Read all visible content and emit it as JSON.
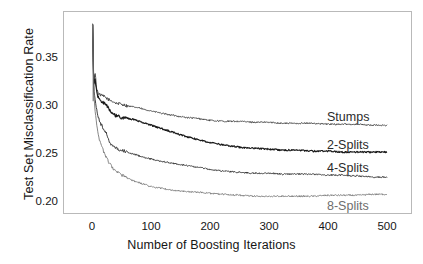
{
  "chart_data": {
    "type": "line",
    "title": "",
    "xlabel": "Number of Boosting Iterations",
    "ylabel": "Test Set Misclassification Rate",
    "xlim": [
      0,
      500
    ],
    "ylim": [
      0.19,
      0.395
    ],
    "grid": false,
    "legend_position": "inline-right",
    "xticks": [
      "0",
      "100",
      "200",
      "300",
      "400",
      "500"
    ],
    "xtick_values": [
      0,
      100,
      200,
      300,
      400,
      500
    ],
    "yticks": [
      "0.20",
      "0.25",
      "0.30",
      "0.35"
    ],
    "ytick_values": [
      0.2,
      0.25,
      0.3,
      0.35
    ],
    "x": [
      1,
      3,
      5,
      8,
      10,
      13,
      16,
      20,
      25,
      30,
      35,
      40,
      50,
      60,
      70,
      80,
      90,
      100,
      120,
      140,
      160,
      180,
      200,
      225,
      250,
      275,
      300,
      325,
      350,
      375,
      400,
      425,
      450,
      475,
      500
    ],
    "series": [
      {
        "name": "Stumps",
        "color": "#444444",
        "values": [
          0.385,
          0.322,
          0.336,
          0.318,
          0.314,
          0.312,
          0.311,
          0.31,
          0.308,
          0.306,
          0.305,
          0.303,
          0.302,
          0.3,
          0.299,
          0.298,
          0.296,
          0.295,
          0.292,
          0.29,
          0.288,
          0.287,
          0.285,
          0.284,
          0.284,
          0.283,
          0.283,
          0.282,
          0.282,
          0.282,
          0.281,
          0.281,
          0.281,
          0.28,
          0.28
        ]
      },
      {
        "name": "2-Splits",
        "color": "#1a1a1a",
        "values": [
          0.385,
          0.32,
          0.33,
          0.314,
          0.31,
          0.307,
          0.305,
          0.303,
          0.3,
          0.296,
          0.292,
          0.29,
          0.288,
          0.287,
          0.286,
          0.284,
          0.282,
          0.28,
          0.276,
          0.272,
          0.268,
          0.265,
          0.262,
          0.259,
          0.257,
          0.256,
          0.255,
          0.254,
          0.254,
          0.253,
          0.253,
          0.252,
          0.252,
          0.252,
          0.252
        ]
      },
      {
        "name": "4-Splits",
        "color": "#333333",
        "values": [
          0.385,
          0.318,
          0.308,
          0.296,
          0.29,
          0.284,
          0.28,
          0.276,
          0.271,
          0.262,
          0.258,
          0.256,
          0.254,
          0.252,
          0.25,
          0.248,
          0.246,
          0.245,
          0.242,
          0.24,
          0.238,
          0.236,
          0.234,
          0.232,
          0.231,
          0.23,
          0.23,
          0.229,
          0.229,
          0.229,
          0.228,
          0.228,
          0.227,
          0.226,
          0.226
        ]
      },
      {
        "name": "8-Splits",
        "color": "#808080",
        "values": [
          0.385,
          0.315,
          0.296,
          0.28,
          0.272,
          0.264,
          0.258,
          0.252,
          0.245,
          0.24,
          0.235,
          0.232,
          0.228,
          0.225,
          0.222,
          0.22,
          0.218,
          0.216,
          0.214,
          0.212,
          0.211,
          0.21,
          0.209,
          0.208,
          0.207,
          0.206,
          0.206,
          0.206,
          0.206,
          0.206,
          0.207,
          0.207,
          0.207,
          0.208,
          0.208
        ]
      }
    ],
    "series_labels": [
      {
        "text": "Stumps",
        "x": 327,
        "y": 110,
        "color": "#2b2b2b"
      },
      {
        "text": "2-Splits",
        "x": 327,
        "y": 138,
        "color": "#2b2b2b"
      },
      {
        "text": "4-Splits",
        "x": 327,
        "y": 161,
        "color": "#2b2b2b"
      },
      {
        "text": "8-Splits",
        "x": 327,
        "y": 199,
        "color": "#6e6e6e"
      }
    ]
  }
}
